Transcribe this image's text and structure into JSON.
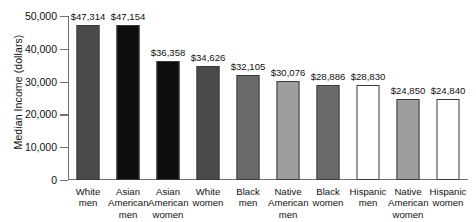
{
  "chart_data": {
    "type": "bar",
    "title": "",
    "xlabel": "",
    "ylabel": "Median Income (dollars)",
    "ylim": [
      0,
      50000
    ],
    "grid": false,
    "legend": "none",
    "y_ticks": [
      "0",
      "10,000",
      "20,000",
      "30,000",
      "40,000",
      "50,000"
    ],
    "y_tick_values": [
      0,
      10000,
      20000,
      30000,
      40000,
      50000
    ],
    "categories": [
      "White men",
      "Asian American men",
      "Asian American women",
      "White women",
      "Black men",
      "Native American men",
      "Black women",
      "Hispanic men",
      "Native American women",
      "Hispanic women"
    ],
    "category_lines": [
      [
        "White",
        "men"
      ],
      [
        "Asian",
        "American",
        "men"
      ],
      [
        "Asian",
        "American",
        "women"
      ],
      [
        "White",
        "women"
      ],
      [
        "Black",
        "men"
      ],
      [
        "Native",
        "American",
        "men"
      ],
      [
        "Black",
        "women"
      ],
      [
        "Hispanic",
        "men"
      ],
      [
        "Native",
        "American",
        "women"
      ],
      [
        "Hispanic",
        "women"
      ]
    ],
    "values": [
      47314,
      47154,
      36358,
      34626,
      32105,
      30076,
      28886,
      28830,
      24850,
      24840
    ],
    "value_labels": [
      "$47,314",
      "$47,154",
      "$36,358",
      "$34,626",
      "$32,105",
      "$30,076",
      "$28,886",
      "$28,830",
      "$24,850",
      "$24,840"
    ],
    "bar_colors": [
      "#4a4a4a",
      "#0d0d0d",
      "#0d0d0d",
      "#4a4a4a",
      "#6a6a6a",
      "#9e9e9e",
      "#6a6a6a",
      "#ffffff",
      "#9e9e9e",
      "#ffffff"
    ],
    "bar_edge_color": "#3a3a3a",
    "axis_color": "#6f6f6f",
    "text_color": "#111111",
    "background": "#ffffff"
  }
}
